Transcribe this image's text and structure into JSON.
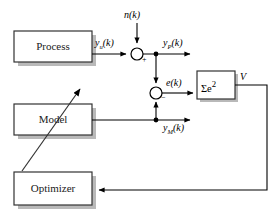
{
  "diagram": {
    "title_text": "",
    "blocks": [
      {
        "id": "process",
        "label": "Process",
        "x": 14,
        "y": 31,
        "w": 78,
        "h": 31
      },
      {
        "id": "model",
        "label": "Model",
        "x": 14,
        "y": 104,
        "w": 78,
        "h": 31
      },
      {
        "id": "optimizer",
        "label": "Optimizer",
        "x": 14,
        "y": 172,
        "w": 78,
        "h": 33
      },
      {
        "id": "cost",
        "label": "Σe",
        "label_sup": "2",
        "x": 197,
        "y": 71,
        "w": 38,
        "h": 28
      }
    ],
    "signals": {
      "noise": "n(k)",
      "process_undisturbed": "y",
      "process_undisturbed_sub": "u",
      "process_undisturbed_tail": "(k)",
      "process_output": "y",
      "process_output_sub": "P",
      "process_output_tail": "(k)",
      "error": "e(k)",
      "model_output": "y",
      "model_output_sub": "M",
      "model_output_tail": "(k)",
      "cost_output": "V"
    },
    "junctions": [
      {
        "id": "noise-sum",
        "cx": 137,
        "cy": 54,
        "r": 6,
        "sign": "+"
      },
      {
        "id": "error-sum",
        "cx": 156,
        "cy": 93,
        "r": 6,
        "sign": "−"
      }
    ],
    "colors": {
      "line": "#000000",
      "box_stroke": "#333333",
      "box_fill": "#ffffff",
      "shadow": "#b9b9b9",
      "text": "#1a1a1a"
    }
  }
}
